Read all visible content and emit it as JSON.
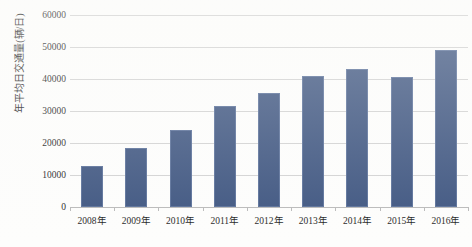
{
  "chart_data": {
    "type": "bar",
    "title": "",
    "xlabel": "",
    "ylabel": "年平均日交通量(辆/日)",
    "categories": [
      "2008年",
      "2009年",
      "2010年",
      "2011年",
      "2012年",
      "2013年",
      "2014年",
      "2015年",
      "2016年"
    ],
    "values": [
      12800,
      18500,
      24000,
      31500,
      35700,
      41000,
      43000,
      40500,
      49000
    ],
    "ylim": [
      0,
      60000
    ],
    "ytick_values": [
      0,
      10000,
      20000,
      30000,
      40000,
      50000,
      60000
    ],
    "ytick_labels": [
      "0",
      "10000",
      "20000",
      "30000",
      "40000",
      "50000",
      "60000"
    ],
    "grid": true,
    "legend": false,
    "legend_position": "none",
    "series": [
      {
        "name": "年平均日交通量",
        "color": "#3e5580",
        "values": [
          12800,
          18500,
          24000,
          31500,
          35700,
          41000,
          43000,
          40500,
          49000
        ]
      }
    ]
  },
  "colors": {
    "bar_fill": "#3e5580",
    "bar_edge": "#5a7099",
    "gridline": "#d2d2d2",
    "axis": "#b9b9b9",
    "text": "#1f1f1f",
    "background": "#fdfdfc"
  }
}
